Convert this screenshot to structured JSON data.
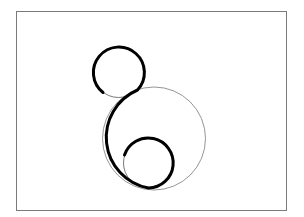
{
  "figure": {
    "frame": {
      "x": 16.5,
      "y": 11.5,
      "width": 270,
      "height": 199,
      "stroke": "#7a7a7a",
      "stroke_width": 1
    },
    "circles": [
      {
        "name": "top-small-circle",
        "cx": 118.5,
        "cy": 72,
        "r": 25.5,
        "stroke": "#555555",
        "stroke_width": 0.8
      },
      {
        "name": "large-circle",
        "cx": 154,
        "cy": 138.5,
        "r": 51.5,
        "stroke": "#7a7a7a",
        "stroke_width": 0.8
      },
      {
        "name": "bottom-small-circle",
        "cx": 148.5,
        "cy": 163,
        "r": 25,
        "stroke": "#555555",
        "stroke_width": 0.8
      }
    ],
    "thick_curve": {
      "stroke": "#000000",
      "stroke_width": 3,
      "path": "M 103 92.5 A 25.5 25.5 0 1 1 137.5 90 A 51.5 51.5 0 0 0 148.5 188 A 25 25 0 1 0 124.5 155"
    }
  }
}
